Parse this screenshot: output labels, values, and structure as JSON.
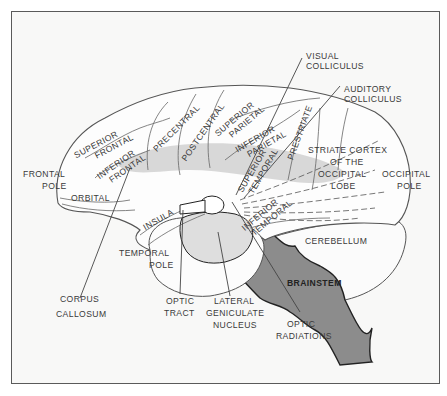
{
  "figure": {
    "type": "diagram",
    "colors": {
      "paper": "#f8f8f7",
      "frame": "#5a5a5a",
      "line": "#555555",
      "corpus_callosum_band": "#d4d4d4",
      "temporal_inner_region": "#dedede",
      "brainstem": "#8c8c8c",
      "text": "#3a3a3a"
    }
  },
  "labels": {
    "visual_colliculus": [
      "VISUAL",
      "COLLICULUS"
    ],
    "auditory_colliculus": [
      "AUDITORY",
      "COLLICULUS"
    ],
    "superior_frontal": [
      "SUPERIOR",
      "FRONTAL"
    ],
    "inferior_frontal": [
      "INFERIOR",
      "FRONTAL"
    ],
    "precentral": "PRECENTRAL",
    "postcentral": "POSTCENTRAL",
    "superior_parietal": [
      "SUPERIOR",
      "PARIETAL"
    ],
    "inferior_parietal": [
      "INFERIOR",
      "PARIETAL"
    ],
    "prestriate": "PRESTRIATE",
    "striate_cortex": [
      "STRIATE CORTEX",
      "OF THE",
      "OCCIPITAL",
      "LOBE"
    ],
    "occipital_pole": [
      "OCCIPITAL",
      "POLE"
    ],
    "frontal_pole": [
      "FRONTAL",
      "POLE"
    ],
    "orbital": "ORBITAL",
    "insula": "INSULA",
    "superior_temporal": [
      "SUPERIOR",
      "TEMPORAL"
    ],
    "inferior_temporal": [
      "INFERIOR",
      "TEMPORAL"
    ],
    "cerebellum": "CEREBELLUM",
    "brainstem": "BRAINSTEM",
    "temporal_pole": [
      "TEMPORAL",
      "POLE"
    ],
    "corpus_callosum": [
      "CORPUS",
      "CALLOSUM"
    ],
    "optic_tract": [
      "OPTIC",
      "TRACT"
    ],
    "lateral_geniculate_nucleus": [
      "LATERAL",
      "GENICULATE",
      "NUCLEUS"
    ],
    "optic_radiations": [
      "OPTIC",
      "RADIATIONS"
    ]
  }
}
